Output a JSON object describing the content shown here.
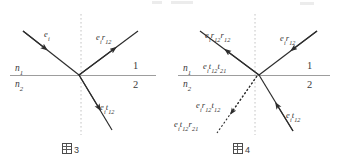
{
  "page": {
    "width": 339,
    "height": 161,
    "background": "#ffffff",
    "ink_color": "#333333",
    "interface_color": "#9a9a9a",
    "normal_color": "#bdbdbd"
  },
  "figures": [
    {
      "id": "figure-left",
      "caption": {
        "glyph": "tofu-box",
        "number": "3",
        "text": "図 3"
      },
      "media": {
        "upper_label": "n",
        "upper_sub": "1",
        "lower_label": "n",
        "lower_sub": "2",
        "upper_region": "1",
        "lower_region": "2"
      },
      "rays": [
        {
          "name": "incident-ray",
          "label_main": "e",
          "label_sub": "i",
          "label_rest": "",
          "label_text": "e_i",
          "direction": "down-right",
          "style": "solid",
          "arrow": true
        },
        {
          "name": "reflected-ray",
          "label_main": "e",
          "label_sub": "i",
          "label_rest": "r",
          "label_rest_sub": "12",
          "label_text": "e_i r_12",
          "direction": "up-right",
          "style": "solid",
          "arrow": true
        },
        {
          "name": "transmitted-ray",
          "label_main": "e",
          "label_sub": "i",
          "label_rest": "t",
          "label_rest_sub": "12",
          "label_text": "e_i t_12",
          "direction": "down-right",
          "style": "solid",
          "arrow": true
        }
      ]
    },
    {
      "id": "figure-right",
      "caption": {
        "glyph": "tofu-box",
        "number": "4",
        "text": "図 4"
      },
      "media": {
        "upper_label": "n",
        "upper_sub": "1",
        "lower_label": "n",
        "lower_sub": "2",
        "upper_region": "1",
        "lower_region": "2"
      },
      "rays": [
        {
          "name": "incident-reflected-ray",
          "label_text": "e_i r_12",
          "direction": "down-left",
          "style": "solid",
          "arrow": true
        },
        {
          "name": "double-reflected-ray",
          "label_text": "e_i r_12 r_12",
          "direction": "up-left",
          "style": "solid",
          "arrow": true
        },
        {
          "name": "double-transmitted-ray",
          "label_text": "e_i t_12 t_21",
          "direction": "up-left",
          "style": "solid",
          "arrow": false
        },
        {
          "name": "reflected-transmitted-ray",
          "label_text": "e_i r_12 t_12",
          "direction": "down-left",
          "style": "dotted",
          "arrow": true
        },
        {
          "name": "transmitted-reflected-ray",
          "label_text": "e_i t_12 r_21",
          "direction": "down-left",
          "style": "dotted",
          "arrow": false
        },
        {
          "name": "transmitted-ray",
          "label_text": "e_i t_12",
          "direction": "down-right",
          "style": "solid",
          "arrow": true
        }
      ]
    }
  ],
  "labels": {
    "e": "e",
    "i": "i",
    "r": "r",
    "t": "t",
    "s12": "12",
    "s21": "21",
    "s1": "1",
    "s2": "2",
    "n": "n",
    "one": "1",
    "two": "2",
    "three": "3",
    "four": "4"
  }
}
